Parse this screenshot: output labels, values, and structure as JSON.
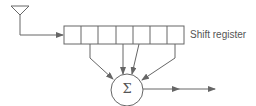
{
  "diagram": {
    "type": "block-diagram",
    "title": "",
    "register_label": "Shift register",
    "summer_symbol": "Σ",
    "register_cells": 7,
    "stroke_color": "#666666",
    "text_color": "#555555",
    "nodes": [
      {
        "id": "antenna",
        "shape": "triangle-antenna"
      },
      {
        "id": "shift-register",
        "shape": "segmented-rectangle",
        "label": "Shift register",
        "cells": 7
      },
      {
        "id": "summer",
        "shape": "circle",
        "label": "Σ"
      }
    ],
    "edges": [
      {
        "from": "antenna",
        "to": "shift-register",
        "arrow": true
      },
      {
        "from": "shift-register.cell-2",
        "to": "summer",
        "arrow": true
      },
      {
        "from": "shift-register.cell-4",
        "to": "summer",
        "arrow": true
      },
      {
        "from": "shift-register.cell-5",
        "to": "summer",
        "arrow": true
      },
      {
        "from": "shift-register.cell-7",
        "to": "summer",
        "arrow": true
      },
      {
        "from": "summer",
        "to": "output",
        "arrow": true
      }
    ]
  }
}
